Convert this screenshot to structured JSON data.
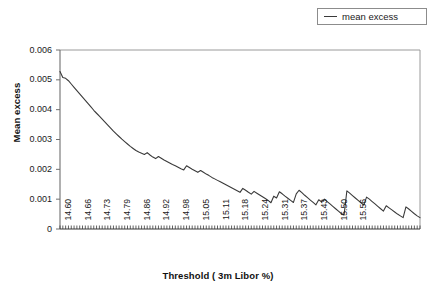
{
  "chart_data": {
    "type": "line",
    "title": "",
    "xlabel": "Threshold ( 3m Libor %)",
    "ylabel": "Mean excess",
    "ylim": [
      0,
      0.006
    ],
    "yticks": [
      "0",
      "0.001",
      "0.002",
      "0.003",
      "0.004",
      "0.005",
      "0.006"
    ],
    "ytick_values": [
      0,
      0.001,
      0.002,
      0.003,
      0.004,
      0.005,
      0.006
    ],
    "xticklabels": [
      "14.60",
      "14.66",
      "14.73",
      "14.79",
      "14.86",
      "14.92",
      "14.98",
      "15.05",
      "15.11",
      "15.18",
      "15.24",
      "15.31",
      "15.37",
      "15.43",
      "15.50",
      "15.56"
    ],
    "xtick_label_every": 7,
    "grid": false,
    "legend_position": "top-right",
    "series": [
      {
        "name": "mean excess",
        "color": "#3a3a3a",
        "values": [
          0.00528,
          0.00508,
          0.00505,
          0.00497,
          0.00486,
          0.00475,
          0.00464,
          0.00453,
          0.00442,
          0.00431,
          0.0042,
          0.00409,
          0.00398,
          0.00388,
          0.00378,
          0.00368,
          0.00358,
          0.00348,
          0.00338,
          0.00328,
          0.00319,
          0.0031,
          0.00301,
          0.00293,
          0.00285,
          0.00277,
          0.0027,
          0.00263,
          0.00258,
          0.00254,
          0.0025,
          0.00256,
          0.00248,
          0.00241,
          0.00236,
          0.00243,
          0.00237,
          0.00231,
          0.00226,
          0.00221,
          0.00216,
          0.00212,
          0.00207,
          0.00202,
          0.00198,
          0.00212,
          0.00206,
          0.002,
          0.00195,
          0.0019,
          0.00196,
          0.0019,
          0.00184,
          0.00179,
          0.00173,
          0.00168,
          0.00163,
          0.00158,
          0.00153,
          0.00148,
          0.00143,
          0.00138,
          0.00133,
          0.00128,
          0.00123,
          0.00136,
          0.0013,
          0.00123,
          0.00117,
          0.00126,
          0.0012,
          0.00114,
          0.00108,
          0.00102,
          0.00096,
          0.00088,
          0.0011,
          0.00104,
          0.00125,
          0.00118,
          0.0011,
          0.00103,
          0.00096,
          0.00089,
          0.00118,
          0.0013,
          0.00122,
          0.00113,
          0.00105,
          0.00097,
          0.00089,
          0.00081,
          0.00098,
          0.00091,
          0.001,
          0.00092,
          0.00084,
          0.00076,
          0.00068,
          0.0006,
          0.00052,
          0.00047,
          0.00128,
          0.0012,
          0.00112,
          0.00104,
          0.00096,
          0.00088,
          0.0008,
          0.00107,
          0.001,
          0.00092,
          0.00084,
          0.00076,
          0.00068,
          0.0006,
          0.00078,
          0.00071,
          0.00064,
          0.00057,
          0.0005,
          0.00044,
          0.00038,
          0.00074,
          0.00067,
          0.00059,
          0.00051,
          0.00044,
          0.00038
        ]
      }
    ]
  },
  "legend": {
    "entries": [
      {
        "label": "mean excess",
        "color": "#3a3a3a"
      }
    ]
  },
  "axes": {
    "y_title": "Mean excess",
    "x_title": "Threshold ( 3m Libor %)"
  }
}
